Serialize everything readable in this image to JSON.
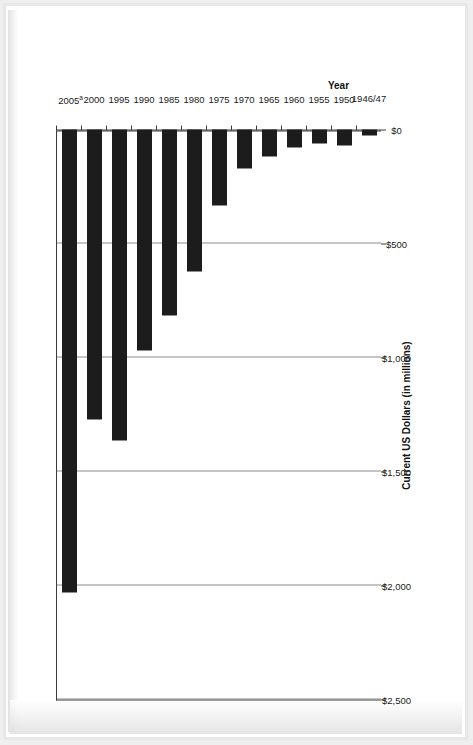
{
  "chart_data": {
    "type": "bar",
    "orientation": "horizontal",
    "title": "",
    "subtitle": "",
    "xlabel": "Current US Dollars (in millions)",
    "ylabel": "Year",
    "categories": [
      "1946/47",
      "1950",
      "1955",
      "1960",
      "1965",
      "1970",
      "1975",
      "1980",
      "1985",
      "1990",
      "1995",
      "2000",
      "2005"
    ],
    "category_labels_display": [
      "1946/47",
      "1950",
      "1955",
      "1960",
      "1965",
      "1970",
      "1975",
      "1980",
      "1985",
      "1990",
      "1995",
      "2000",
      "2005"
    ],
    "category_footnote_marker": "a",
    "category_footnote_on": "2005",
    "values": [
      25,
      70,
      60,
      80,
      120,
      170,
      335,
      622,
      817,
      970,
      1362,
      1271,
      2030
    ],
    "value_tick_labels": [
      "$2,500",
      "$2,000",
      "$1,500",
      "$1,000",
      "$500",
      "$0"
    ],
    "value_ticks": [
      2500,
      2000,
      1500,
      1000,
      500,
      0
    ],
    "xlim": [
      0,
      2500
    ],
    "grid": true,
    "grid_axis": "value",
    "legend": "none",
    "bar_color": "#1c1c1c",
    "gridline_color": "#8c8c8c",
    "axis_color": "#3a3a3a",
    "rotation_on_page": "-90deg"
  },
  "page": {
    "background": "#ffffff",
    "frame_color": "#e8e8e8"
  }
}
